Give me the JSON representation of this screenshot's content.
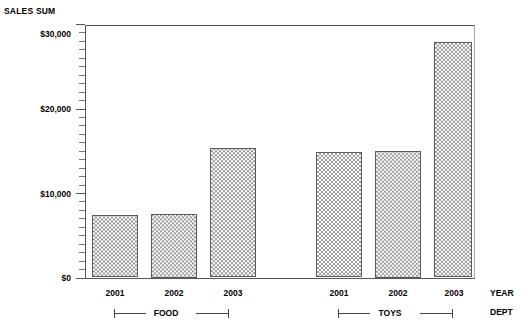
{
  "chart_data": {
    "type": "bar",
    "title": "",
    "ylabel": "SALES SUM",
    "xlabel": "",
    "ylim": [
      0,
      30000
    ],
    "grid": false,
    "legend": "none",
    "y_axis": {
      "label": "SALES SUM",
      "ticks": [
        "$0",
        "$10,000",
        "$20,000",
        "$30,000"
      ],
      "tick_values": [
        0,
        10000,
        20000,
        30000
      ],
      "minor_ticks_per_interval": 9
    },
    "x_axis": {
      "row_labels": [
        "YEAR",
        "DEPT"
      ],
      "categories": [
        "2001",
        "2002",
        "2003",
        "2001",
        "2002",
        "2003"
      ],
      "groups": [
        {
          "label": "FOOD",
          "categories": [
            "2001",
            "2002",
            "2003"
          ]
        },
        {
          "label": "TOYS",
          "categories": [
            "2001",
            "2002",
            "2003"
          ]
        }
      ]
    },
    "series": [
      {
        "name": "SALES SUM",
        "values": [
          7400,
          7500,
          15300,
          14900,
          15000,
          27900
        ]
      }
    ],
    "bars": [
      {
        "group": "FOOD",
        "year": "2001",
        "value": 7400,
        "left": 92,
        "width": 46
      },
      {
        "group": "FOOD",
        "year": "2002",
        "value": 7500,
        "left": 151,
        "width": 46
      },
      {
        "group": "FOOD",
        "year": "2003",
        "value": 15300,
        "left": 210,
        "width": 46
      },
      {
        "group": "TOYS",
        "year": "2001",
        "value": 14900,
        "left": 316,
        "width": 46
      },
      {
        "group": "TOYS",
        "year": "2002",
        "value": 15000,
        "left": 375,
        "width": 46
      },
      {
        "group": "TOYS",
        "year": "2003",
        "value": 27900,
        "left": 434,
        "width": 38
      }
    ]
  },
  "axis": {
    "sales_sum_label": "SALES SUM",
    "year_row_label": "YEAR",
    "dept_row_label": "DEPT"
  },
  "ylabels": {
    "t0": "$0",
    "t1": "$10,000",
    "t2": "$20,000",
    "t3": "$30,000"
  },
  "xlabels": {
    "food_2001": "2001",
    "food_2002": "2002",
    "food_2003": "2003",
    "toys_2001": "2001",
    "toys_2002": "2002",
    "toys_2003": "2003"
  },
  "groups": {
    "food": "FOOD",
    "toys": "TOYS"
  },
  "colors": {
    "axis": "#555555",
    "bar_outline": "#5a5a5a",
    "bar_pattern": "#9a9a9a",
    "bar_background": "#ffffff",
    "text": "#000000",
    "page_background": "#ffffff"
  }
}
